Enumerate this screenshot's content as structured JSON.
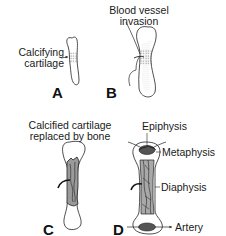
{
  "diagram": {
    "stages": [
      {
        "id": "A",
        "label": "A",
        "annotations": [
          "Calcifying\ncartilage"
        ]
      },
      {
        "id": "B",
        "label": "B",
        "annotations": [
          "Blood vessel\ninvasion"
        ]
      },
      {
        "id": "C",
        "label": "C",
        "annotations": [
          "Calcified cartilage\nreplaced by bone"
        ]
      },
      {
        "id": "D",
        "label": "D",
        "annotations": [
          "Epiphysis",
          "Metaphysis",
          "Diaphysis",
          "Artery"
        ]
      }
    ],
    "labels": {
      "calcifying_1": "Calcifying",
      "calcifying_2": "cartilage",
      "blood_1": "Blood vessel",
      "blood_2": "invasion",
      "calcified_1": "Calcified cartilage",
      "calcified_2": "replaced by bone",
      "epiphysis": "Epiphysis",
      "metaphysis": "Metaphysis",
      "diaphysis": "Diaphysis",
      "artery": "Artery",
      "stage_a": "A",
      "stage_b": "B",
      "stage_c": "C",
      "stage_d": "D"
    },
    "colors": {
      "ink": "#1a1a1a",
      "shading": "#9a9a9a",
      "background": "#ffffff"
    }
  }
}
